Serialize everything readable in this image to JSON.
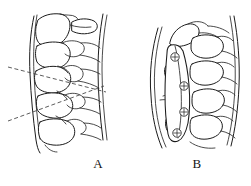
{
  "figure": {
    "kind": "line-drawing",
    "background_color": "#ffffff",
    "ink_color": "#1b1b1b",
    "dash_color": "#4a4a4a",
    "width": 251,
    "height": 186,
    "panels": [
      {
        "id": "A",
        "caption": "A",
        "caption_x": 98,
        "caption_y": 163,
        "description": "lateral cervical spine with dashed measurement lines",
        "annotations": {
          "measure_lines": [
            {
              "name": "upper-dashed-measure-line",
              "x1": 8,
              "y1": 67,
              "x2": 106,
              "y2": 92
            },
            {
              "name": "lower-dashed-measure-line",
              "x1": 8,
              "y1": 121,
              "x2": 104,
              "y2": 86
            }
          ]
        }
      },
      {
        "id": "B",
        "caption": "B",
        "caption_x": 197,
        "caption_y": 163,
        "description": "lateral cervical spine with anterior plate and four fixation screws",
        "annotations": {
          "plate": {
            "name": "anterior-cervical-plate"
          },
          "screws": [
            {
              "name": "screw-1",
              "cx": 175,
              "cy": 57,
              "r": 4.2
            },
            {
              "name": "screw-2",
              "cx": 184,
              "cy": 86,
              "r": 4.2
            },
            {
              "name": "screw-3",
              "cx": 184,
              "cy": 112,
              "r": 4.2
            },
            {
              "name": "screw-4",
              "cx": 177,
              "cy": 133,
              "r": 4.2
            }
          ]
        }
      }
    ]
  }
}
